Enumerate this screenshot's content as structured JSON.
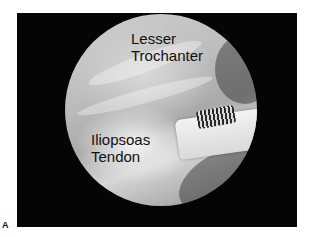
{
  "figure": {
    "panel_label": "A",
    "labels": {
      "top_line1": "Lesser",
      "top_line2": "Trochanter",
      "bottom_line1": "Iliopsoas",
      "bottom_line2": "Tendon"
    },
    "colors": {
      "frame": "#050505",
      "background": "#ffffff",
      "text": "#111111"
    }
  }
}
